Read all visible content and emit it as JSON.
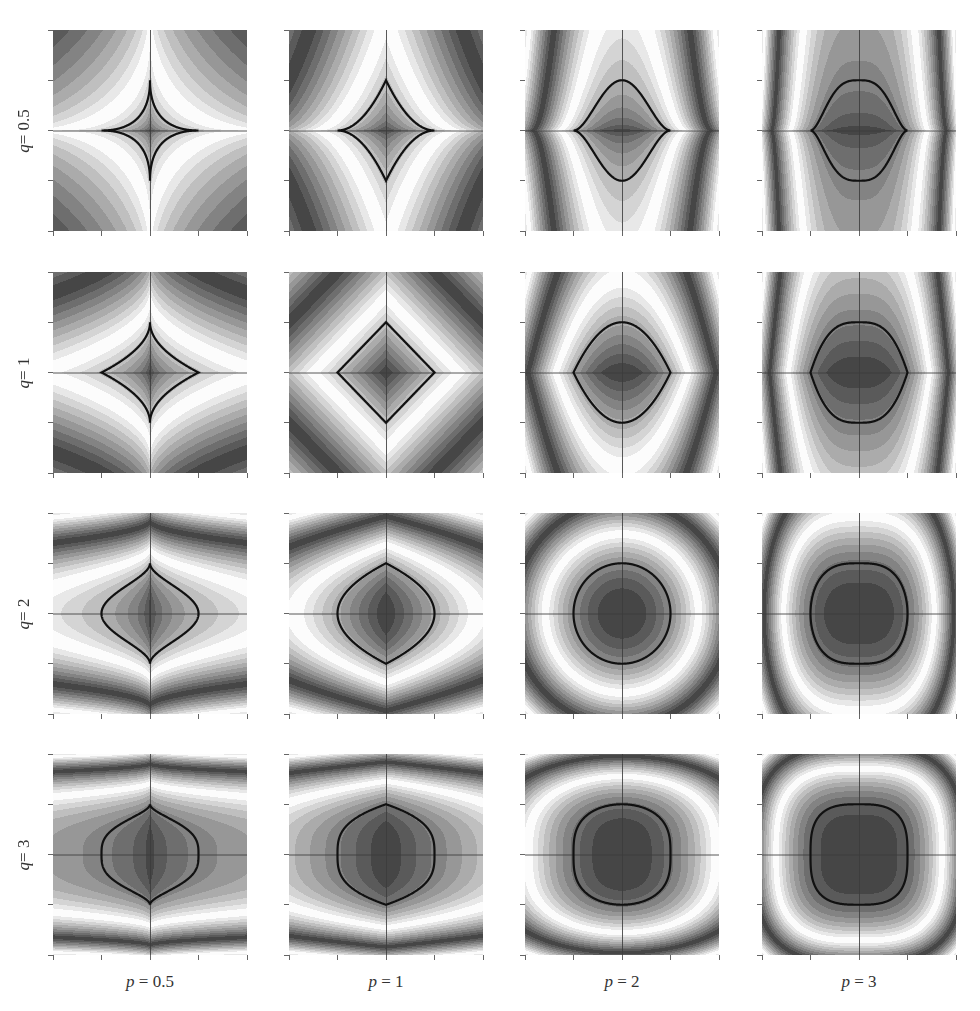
{
  "chart_data": {
    "type": "heatmap",
    "title": "",
    "xlim": [
      -2,
      2
    ],
    "ylim": [
      -2,
      2
    ],
    "ticks": [
      -2,
      -1,
      0,
      1,
      2
    ],
    "grid": false,
    "col_param": "p",
    "row_param": "q",
    "p_values": [
      0.5,
      1,
      2,
      3
    ],
    "q_values": [
      0.5,
      1,
      2,
      3
    ],
    "col_labels": [
      "p = 0.5",
      "p = 1",
      "p = 2",
      "p = 3"
    ],
    "row_labels": [
      "q = 0.5",
      "q = 1",
      "q = 2",
      "q = 3"
    ],
    "contour_level": 1,
    "colormap": "grayscale banded (dark → white → dark)",
    "bands": 10
  },
  "layout": {
    "col_x": [
      53,
      289,
      525,
      762
    ],
    "row_y": [
      30,
      272,
      513,
      754
    ],
    "panel_w": 194,
    "panel_h": 201
  },
  "labels": {
    "rows": [
      {
        "var": "q",
        "eq": " = 0.5"
      },
      {
        "var": "q",
        "eq": " = 1"
      },
      {
        "var": "q",
        "eq": " = 2"
      },
      {
        "var": "q",
        "eq": " = 3"
      }
    ],
    "cols": [
      {
        "var": "p",
        "eq": " = 0.5"
      },
      {
        "var": "p",
        "eq": " = 1"
      },
      {
        "var": "p",
        "eq": " = 2"
      },
      {
        "var": "p",
        "eq": " = 3"
      }
    ]
  }
}
